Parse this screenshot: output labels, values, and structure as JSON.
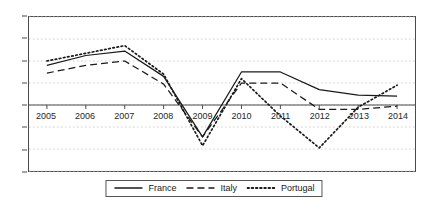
{
  "chart_data": {
    "type": "line",
    "title": "",
    "subtitle": "",
    "xlabel": "",
    "ylabel": "",
    "x": [
      2005,
      2006,
      2007,
      2008,
      2009,
      2010,
      2011,
      2012,
      2013,
      2014
    ],
    "categories": [
      "2005",
      "2006",
      "2007",
      "2008",
      "2009",
      "2010",
      "2011",
      "2012",
      "2013",
      "2014"
    ],
    "xlim": [
      2005,
      2014
    ],
    "ylim": [
      -6,
      8
    ],
    "y_ticks": [
      8,
      6,
      4,
      2,
      0,
      -2,
      -4,
      -6
    ],
    "y_tick_labels": [
      "8",
      "6",
      "4",
      "2",
      "0",
      "-2",
      "-4",
      "-6"
    ],
    "grid": true,
    "grid_style": "dotted-horizontal",
    "zero_line": true,
    "legend_position": "bottom-center",
    "series": [
      {
        "name": "France",
        "style": "solid",
        "color": "#1a1a1a",
        "values": [
          3.6,
          4.5,
          4.9,
          2.6,
          -2.9,
          3.0,
          3.0,
          1.4,
          0.9,
          0.8
        ]
      },
      {
        "name": "Italy",
        "style": "dashed",
        "color": "#1a1a1a",
        "values": [
          2.9,
          3.6,
          4.0,
          1.9,
          -2.9,
          2.0,
          2.0,
          -0.4,
          -0.4,
          -0.1
        ]
      },
      {
        "name": "Portugal",
        "style": "dotted",
        "color": "#1a1a1a",
        "values": [
          4.0,
          4.7,
          5.4,
          2.8,
          -3.7,
          2.4,
          -1.0,
          -3.9,
          -0.2,
          1.8
        ]
      }
    ]
  },
  "legend": {
    "items": [
      {
        "label": "France",
        "style": "solid"
      },
      {
        "label": "Italy",
        "style": "dashed"
      },
      {
        "label": "Portugal",
        "style": "dotted"
      }
    ]
  },
  "colors": {
    "line": "#1a1a1a",
    "grid": "#cfcfcf",
    "axis": "#4a4a4a",
    "background": "#ffffff",
    "text": "#262626"
  }
}
